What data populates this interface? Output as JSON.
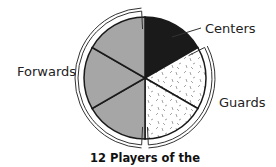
{
  "chart_data": {
    "type": "pie",
    "title": "12 Players of the",
    "total_players": 12,
    "slices": [
      {
        "label": "Centers",
        "count": 2,
        "segments": 1,
        "fill": "#1a1a1a",
        "pattern": "solid"
      },
      {
        "label": "Guards",
        "count": 4,
        "segments": 2,
        "fill": "#ffffff",
        "pattern": "speckled"
      },
      {
        "label": "Forwards",
        "count": 6,
        "segments": 3,
        "fill": "#a6a6a6",
        "pattern": "solid"
      }
    ],
    "legend": "inline-labels"
  }
}
